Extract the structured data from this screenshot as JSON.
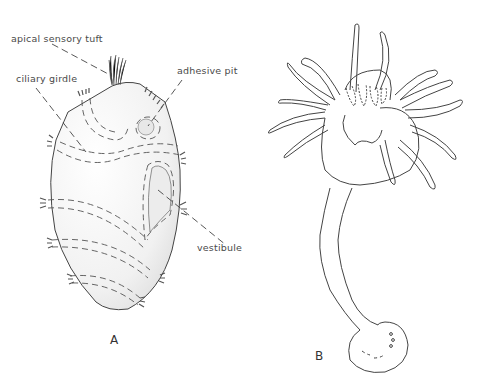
{
  "figure": {
    "panel_a": {
      "letter": "A",
      "subject": "larva",
      "labels": {
        "apical_sensory_tuft": "apical sensory tuft",
        "ciliary_girdle": "ciliary girdle",
        "adhesive_pit": "adhesive pit",
        "vestibule": "vestibule"
      }
    },
    "panel_b": {
      "letter": "B",
      "subject": "polyp with tentacles on stalk"
    }
  }
}
